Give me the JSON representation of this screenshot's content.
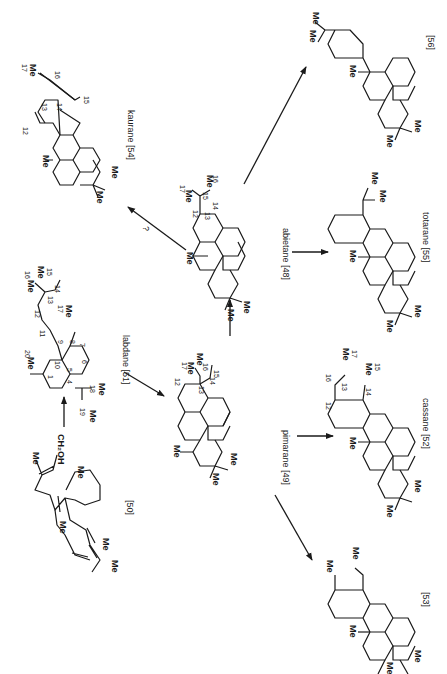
{
  "diagram": {
    "compounds": [
      {
        "id": "50",
        "name": "",
        "label": "[50]",
        "groups": [
          "Me",
          "CH2OH",
          "Me",
          "Me",
          "Me",
          "Me"
        ]
      },
      {
        "id": "51",
        "name": "labdane",
        "label": "labdane [51]",
        "numbers": [
          "1",
          "4",
          "5",
          "6",
          "7",
          "8",
          "9",
          "10",
          "11",
          "12",
          "13",
          "14",
          "15",
          "16",
          "17",
          "18",
          "19",
          "20"
        ]
      },
      {
        "id": "49",
        "name": "pimarane",
        "label": "pimarane [49]",
        "numbers": [
          "12",
          "13",
          "14",
          "15",
          "16",
          "17"
        ]
      },
      {
        "id": "48",
        "name": "abietane",
        "label": "abietane [48]",
        "numbers": [
          "12",
          "13",
          "14",
          "15",
          "16",
          "17"
        ]
      },
      {
        "id": "54",
        "name": "kaurane",
        "label": "kaurane [54]",
        "numbers": [
          "12",
          "13",
          "14",
          "15",
          "16",
          "17"
        ]
      },
      {
        "id": "52",
        "name": "cassane",
        "label": "cassane [52]",
        "numbers": [
          "12",
          "13",
          "14",
          "15",
          "16",
          "17"
        ]
      },
      {
        "id": "55",
        "name": "totarane",
        "label": "totarane [55]"
      },
      {
        "id": "56",
        "name": "",
        "label": "[56]"
      },
      {
        "id": "53",
        "name": "",
        "label": "[53]"
      }
    ],
    "arrows": [
      {
        "from": "50",
        "to": "51",
        "label": ""
      },
      {
        "from": "51",
        "to": "49",
        "label": ""
      },
      {
        "from": "49",
        "to": "48",
        "label": ""
      },
      {
        "from": "48",
        "to": "54",
        "label": "?"
      },
      {
        "from": "48",
        "to": "56",
        "label": ""
      },
      {
        "from": "48",
        "to": "55",
        "label": ""
      },
      {
        "from": "49",
        "to": "52",
        "label": ""
      },
      {
        "from": "49",
        "to": "53",
        "label": ""
      }
    ],
    "texts": {
      "me": "Me",
      "ch2oh": "CH₂OH",
      "q": "?",
      "l50": "[50]",
      "l51": "labdane [51]",
      "l49": "pimarane [49]",
      "l48": "abietane [48]",
      "l54": "kaurane [54]",
      "l52": "cassane [52]",
      "l55": "totarane [55]",
      "l56": "[56]",
      "l53": "[53]"
    }
  }
}
